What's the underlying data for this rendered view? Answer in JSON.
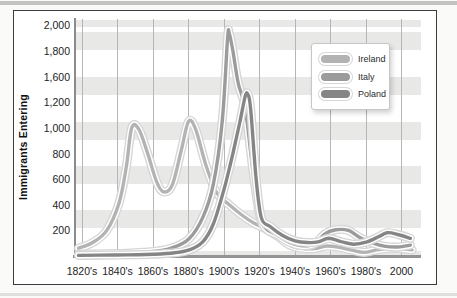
{
  "chart_data": {
    "type": "line",
    "ylabel": "Immigrants Entering",
    "xlabel": "",
    "x_ticks": [
      "1820's",
      "1840's",
      "1860's",
      "1880's",
      "1900's",
      "1920's",
      "1940's",
      "1960's",
      "1980's",
      "2000"
    ],
    "y_ticks": [
      "200",
      "400",
      "600",
      "800",
      "1,000",
      "1,200",
      "1,600",
      "1,800",
      "2,000"
    ],
    "y_tick_values_as_printed": [
      200,
      400,
      600,
      800,
      1000,
      1200,
      1600,
      1800,
      2000
    ],
    "ylim": [
      0,
      2000
    ],
    "x_range_years": [
      1820,
      2005
    ],
    "grid": {
      "vertical_gridlines": true,
      "horizontal_shaded_bands": true
    },
    "legend": {
      "position": "upper-right",
      "entries": [
        "Ireland",
        "Italy",
        "Poland"
      ]
    },
    "series": [
      {
        "name": "Ireland",
        "color": "#b3b3b3",
        "points": [
          [
            1818,
            60
          ],
          [
            1826,
            105
          ],
          [
            1834,
            200
          ],
          [
            1841,
            420
          ],
          [
            1845,
            700
          ],
          [
            1848,
            1000
          ],
          [
            1852,
            990
          ],
          [
            1857,
            800
          ],
          [
            1862,
            580
          ],
          [
            1866,
            500
          ],
          [
            1871,
            560
          ],
          [
            1876,
            830
          ],
          [
            1880,
            1050
          ],
          [
            1884,
            990
          ],
          [
            1890,
            700
          ],
          [
            1896,
            490
          ],
          [
            1903,
            400
          ],
          [
            1910,
            320
          ],
          [
            1917,
            255
          ],
          [
            1923,
            215
          ],
          [
            1930,
            155
          ],
          [
            1937,
            85
          ],
          [
            1944,
            60
          ],
          [
            1951,
            58
          ],
          [
            1958,
            78
          ],
          [
            1965,
            68
          ],
          [
            1972,
            45
          ],
          [
            1979,
            28
          ],
          [
            1986,
            48
          ],
          [
            1993,
            60
          ],
          [
            2000,
            58
          ],
          [
            2006,
            48
          ]
        ]
      },
      {
        "name": "Italy",
        "color": "#9b9b9b",
        "points": [
          [
            1818,
            15
          ],
          [
            1834,
            18
          ],
          [
            1848,
            24
          ],
          [
            1860,
            35
          ],
          [
            1870,
            60
          ],
          [
            1880,
            130
          ],
          [
            1888,
            300
          ],
          [
            1894,
            560
          ],
          [
            1899,
            1050
          ],
          [
            1902,
            1900
          ],
          [
            1903,
            1935
          ],
          [
            1905,
            1800
          ],
          [
            1908,
            1500
          ],
          [
            1912,
            1150
          ],
          [
            1916,
            700
          ],
          [
            1920,
            320
          ],
          [
            1924,
            210
          ],
          [
            1930,
            165
          ],
          [
            1937,
            105
          ],
          [
            1944,
            80
          ],
          [
            1951,
            95
          ],
          [
            1957,
            175
          ],
          [
            1963,
            205
          ],
          [
            1970,
            200
          ],
          [
            1977,
            140
          ],
          [
            1984,
            100
          ],
          [
            1991,
            75
          ],
          [
            1998,
            70
          ],
          [
            2005,
            85
          ]
        ]
      },
      {
        "name": "Poland",
        "color": "#858585",
        "points": [
          [
            1818,
            5
          ],
          [
            1838,
            8
          ],
          [
            1856,
            12
          ],
          [
            1870,
            22
          ],
          [
            1880,
            45
          ],
          [
            1888,
            110
          ],
          [
            1894,
            250
          ],
          [
            1900,
            520
          ],
          [
            1905,
            800
          ],
          [
            1909,
            1050
          ],
          [
            1912,
            1300
          ],
          [
            1913.5,
            1320
          ],
          [
            1915,
            1150
          ],
          [
            1918,
            620
          ],
          [
            1921,
            300
          ],
          [
            1926,
            230
          ],
          [
            1933,
            160
          ],
          [
            1940,
            118
          ],
          [
            1947,
            105
          ],
          [
            1953,
            110
          ],
          [
            1959,
            138
          ],
          [
            1966,
            112
          ],
          [
            1973,
            92
          ],
          [
            1980,
            108
          ],
          [
            1987,
            150
          ],
          [
            1992,
            182
          ],
          [
            1998,
            168
          ],
          [
            2005,
            138
          ]
        ]
      }
    ]
  }
}
